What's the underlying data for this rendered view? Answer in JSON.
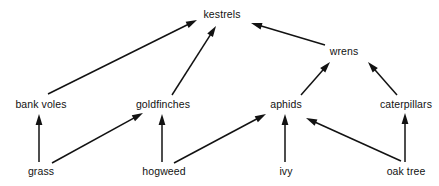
{
  "diagram": {
    "type": "food-web",
    "title": "",
    "canvas": {
      "width": 439,
      "height": 186
    },
    "background_color": "#ffffff",
    "ink_color": "#121212",
    "arrow_meaning": "energy flows in direction of arrow (eaten by)",
    "trophic_levels": [
      {
        "name": "producers",
        "members": [
          "grass",
          "hogweed",
          "ivy",
          "oak tree"
        ]
      },
      {
        "name": "primary-consumers",
        "members": [
          "bank voles",
          "goldfinches",
          "aphids",
          "caterpillars"
        ]
      },
      {
        "name": "secondary-consumers",
        "members": [
          "wrens"
        ]
      },
      {
        "name": "top-predators",
        "members": [
          "kestrels"
        ]
      }
    ],
    "nodes": [
      {
        "id": "kestrels",
        "label": "kestrels",
        "cx": 222,
        "cy": 14,
        "level": "top-predators"
      },
      {
        "id": "wrens",
        "label": "wrens",
        "cx": 344,
        "cy": 51,
        "level": "secondary-consumers"
      },
      {
        "id": "bank_voles",
        "label": "bank voles",
        "cx": 41,
        "cy": 104,
        "level": "primary-consumers"
      },
      {
        "id": "goldfinches",
        "label": "goldfinches",
        "cx": 163,
        "cy": 104,
        "level": "primary-consumers"
      },
      {
        "id": "aphids",
        "label": "aphids",
        "cx": 286,
        "cy": 104,
        "level": "primary-consumers"
      },
      {
        "id": "caterpillars",
        "label": "caterpillars",
        "cx": 406,
        "cy": 104,
        "level": "primary-consumers"
      },
      {
        "id": "grass",
        "label": "grass",
        "cx": 41,
        "cy": 171,
        "level": "producers"
      },
      {
        "id": "hogweed",
        "label": "hogweed",
        "cx": 164,
        "cy": 171,
        "level": "producers"
      },
      {
        "id": "ivy",
        "label": "ivy",
        "cx": 286,
        "cy": 171,
        "level": "producers"
      },
      {
        "id": "oak_tree",
        "label": "oak tree",
        "cx": 406,
        "cy": 171,
        "level": "producers"
      }
    ],
    "edges": [
      {
        "from": "grass",
        "to": "bank_voles",
        "x1": 39,
        "y1": 162,
        "x2": 39,
        "y2": 114
      },
      {
        "from": "grass",
        "to": "goldfinches",
        "x1": 52,
        "y1": 163,
        "x2": 143,
        "y2": 113
      },
      {
        "from": "hogweed",
        "to": "goldfinches",
        "x1": 162,
        "y1": 162,
        "x2": 162,
        "y2": 114
      },
      {
        "from": "hogweed",
        "to": "aphids",
        "x1": 174,
        "y1": 163,
        "x2": 266,
        "y2": 114
      },
      {
        "from": "ivy",
        "to": "aphids",
        "x1": 285,
        "y1": 162,
        "x2": 285,
        "y2": 114
      },
      {
        "from": "oak_tree",
        "to": "aphids",
        "x1": 401,
        "y1": 161,
        "x2": 306,
        "y2": 118
      },
      {
        "from": "oak_tree",
        "to": "caterpillars",
        "x1": 405,
        "y1": 162,
        "x2": 405,
        "y2": 113
      },
      {
        "from": "bank_voles",
        "to": "kestrels",
        "x1": 48,
        "y1": 94,
        "x2": 197,
        "y2": 20
      },
      {
        "from": "goldfinches",
        "to": "kestrels",
        "x1": 172,
        "y1": 95,
        "x2": 216,
        "y2": 26
      },
      {
        "from": "aphids",
        "to": "wrens",
        "x1": 301,
        "y1": 95,
        "x2": 330,
        "y2": 62
      },
      {
        "from": "caterpillars",
        "to": "wrens",
        "x1": 397,
        "y1": 95,
        "x2": 368,
        "y2": 62
      },
      {
        "from": "wrens",
        "to": "kestrels",
        "x1": 325,
        "y1": 45,
        "x2": 251,
        "y2": 23
      }
    ]
  }
}
